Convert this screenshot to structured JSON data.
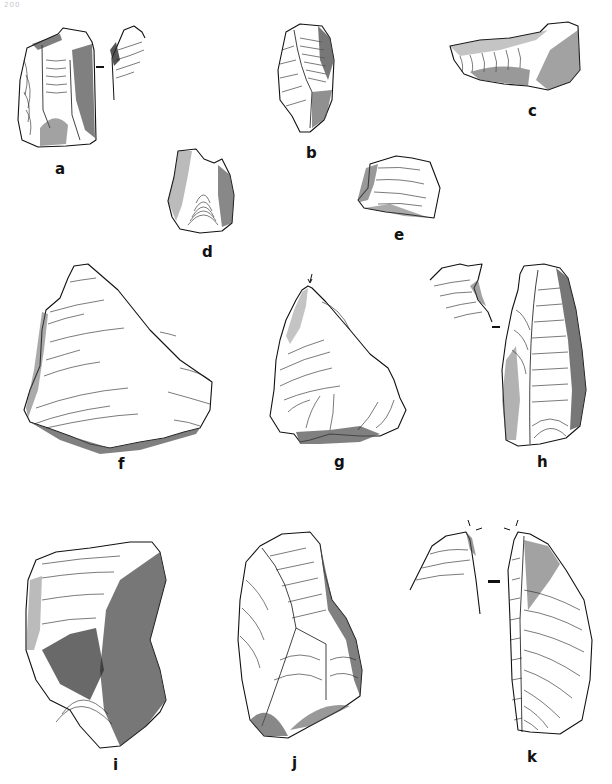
{
  "page": {
    "number": "200"
  },
  "figures": [
    {
      "id": "a",
      "label": "a",
      "has_section_view": true
    },
    {
      "id": "b",
      "label": "b",
      "has_section_view": false
    },
    {
      "id": "c",
      "label": "c",
      "has_section_view": false
    },
    {
      "id": "d",
      "label": "d",
      "has_section_view": false
    },
    {
      "id": "e",
      "label": "e",
      "has_section_view": false
    },
    {
      "id": "f",
      "label": "f",
      "has_section_view": false
    },
    {
      "id": "g",
      "label": "g",
      "has_section_view": false,
      "has_arrow_marker": true
    },
    {
      "id": "h",
      "label": "h",
      "has_section_view": true
    },
    {
      "id": "i",
      "label": "i",
      "has_section_view": false
    },
    {
      "id": "j",
      "label": "j",
      "has_section_view": false
    },
    {
      "id": "k",
      "label": "k",
      "has_section_view": true,
      "has_arrow_marker": true
    }
  ]
}
